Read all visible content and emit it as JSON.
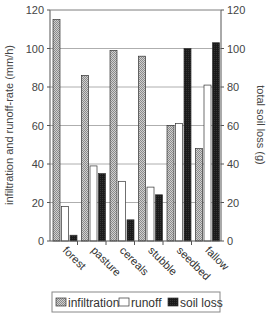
{
  "chart_data": {
    "type": "bar",
    "title": "",
    "categories": [
      "forest",
      "pasture",
      "cereals",
      "stubble",
      "seedbed",
      "fallow"
    ],
    "series": [
      {
        "name": "infiltration",
        "axis": "left",
        "pattern": "hatched-gray",
        "values": [
          115,
          86,
          99,
          96,
          60,
          48
        ]
      },
      {
        "name": "runoff",
        "axis": "left",
        "pattern": "white",
        "values": [
          18,
          39,
          31,
          28,
          61,
          81
        ]
      },
      {
        "name": "soil loss",
        "axis": "right",
        "pattern": "black",
        "values": [
          3,
          35,
          11,
          24,
          100,
          103
        ]
      }
    ],
    "ylabel": "infiltration and runoff-rate (mm/h)",
    "y2label": "total soil loss (g)",
    "ylim": [
      0,
      120
    ],
    "y2lim": [
      0,
      120
    ],
    "yticks": [
      0,
      20,
      40,
      60,
      80,
      100,
      120
    ],
    "y2ticks": [
      0,
      20,
      40,
      60,
      80,
      100,
      120
    ],
    "grid": true,
    "legend_position": "bottom"
  },
  "legend": {
    "items": [
      {
        "label": "infiltration"
      },
      {
        "label": "runoff"
      },
      {
        "label": "soil loss"
      }
    ]
  },
  "colors": {
    "infiltration": "#b8b8b8",
    "runoff": "#ffffff",
    "soil_loss": "#1a1a1a",
    "grid": "#999999",
    "axis": "#555555"
  }
}
